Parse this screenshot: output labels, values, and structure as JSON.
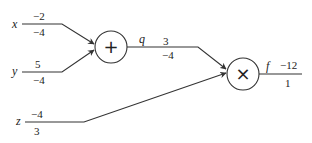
{
  "diagram": {
    "type": "computational-graph",
    "inputs": [
      {
        "name": "x",
        "value": "−2",
        "gradient": "−4"
      },
      {
        "name": "y",
        "value": "5",
        "gradient": "−4"
      },
      {
        "name": "z",
        "value": "−4",
        "gradient": "3"
      }
    ],
    "nodes": [
      {
        "id": "add",
        "symbol": "+"
      },
      {
        "id": "mul",
        "symbol": "×"
      }
    ],
    "intermediate": {
      "name": "q",
      "value": "3",
      "gradient": "−4"
    },
    "output": {
      "name": "f",
      "value": "−12",
      "gradient": "1"
    },
    "edges": [
      {
        "from": "x",
        "to": "add"
      },
      {
        "from": "y",
        "to": "add"
      },
      {
        "from": "add",
        "to": "mul",
        "label": "q"
      },
      {
        "from": "z",
        "to": "mul"
      },
      {
        "from": "mul",
        "to": "f"
      }
    ]
  }
}
